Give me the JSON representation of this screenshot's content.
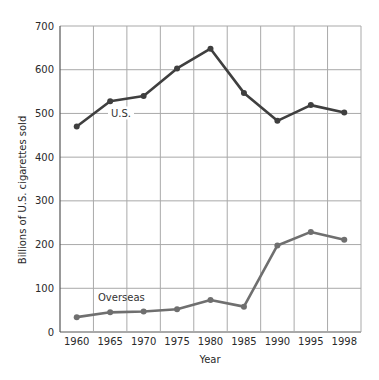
{
  "chart_data": {
    "type": "line",
    "title": "",
    "xlabel": "Year",
    "ylabel": "Billions of U.S. cigarettes sold",
    "categories": [
      "1960",
      "1965",
      "1970",
      "1975",
      "1980",
      "1985",
      "1990",
      "1995",
      "1998"
    ],
    "ylim": [
      0,
      700
    ],
    "yticks": [
      0,
      100,
      200,
      300,
      400,
      500,
      600,
      700
    ],
    "grid": true,
    "legend": "inline labels",
    "series": [
      {
        "name": "U.S.",
        "color": "#3f3f3f",
        "values": [
          470,
          528,
          540,
          603,
          648,
          547,
          483,
          519,
          502
        ]
      },
      {
        "name": "Overseas",
        "color": "#6f6f6f",
        "values": [
          34,
          45,
          47,
          52,
          73,
          58,
          198,
          229,
          211
        ]
      }
    ]
  }
}
